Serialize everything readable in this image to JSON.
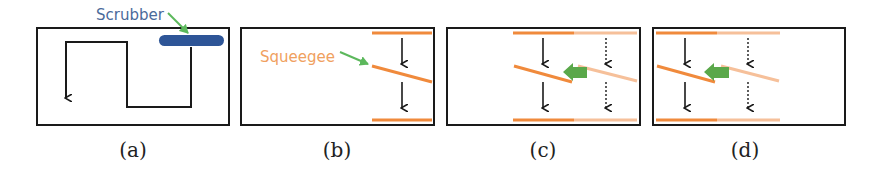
{
  "colors": {
    "frame": "#1a1a1a",
    "scrubber": "#2e5597",
    "scrubber_label": "#4a6a9a",
    "squeegee": "#f08a3c",
    "squeegee_faded": "#f6c09a",
    "squeegee_label": "#f0a060",
    "pointer": "#5cb85c",
    "move_arrow": "#5aa84a"
  },
  "panels": [
    {
      "id": "a",
      "caption": "(a)",
      "labels": {
        "scrubber": "Scrubber"
      },
      "icons": [
        "serpentine-path-arrow",
        "scrubber-bar"
      ]
    },
    {
      "id": "b",
      "caption": "(b)",
      "labels": {
        "squeegee": "Squeegee"
      },
      "icons": [
        "squeegee-line",
        "down-arrow",
        "down-arrow"
      ]
    },
    {
      "id": "c",
      "caption": "(c)",
      "icons": [
        "squeegee-line",
        "faded-squeegee-line",
        "left-block-arrow",
        "down-arrow",
        "dotted-down-arrow"
      ]
    },
    {
      "id": "d",
      "caption": "(d)",
      "icons": [
        "squeegee-line",
        "faded-squeegee-line",
        "left-block-arrow",
        "down-arrow",
        "dotted-down-arrow"
      ]
    }
  ]
}
